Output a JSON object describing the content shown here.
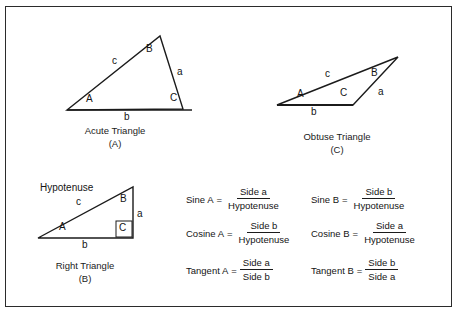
{
  "figure": {
    "border_color": "#2b2b2b",
    "line_color": "#1b1b1b",
    "background": "#ffffff"
  },
  "triangles": [
    {
      "id": "acute",
      "caption": "Acute Triangle",
      "tag": "(A)",
      "vertex_labels": {
        "A": "A",
        "B": "B",
        "C": "C"
      },
      "side_labels": {
        "a": "a",
        "b": "b",
        "c": "c"
      }
    },
    {
      "id": "right",
      "caption": "Right Triangle",
      "tag": "(B)",
      "vertex_labels": {
        "A": "A",
        "B": "B",
        "C": "C"
      },
      "side_labels": {
        "a": "a",
        "b": "b",
        "c": "c"
      },
      "hypotenuse_label": "Hypotenuse",
      "right_angle_marker": true
    },
    {
      "id": "obtuse",
      "caption": "Obtuse Triangle",
      "tag": "(C)",
      "vertex_labels": {
        "A": "A",
        "B": "B",
        "C": "C"
      },
      "side_labels": {
        "a": "a",
        "b": "b",
        "c": "c"
      }
    }
  ],
  "formulas": {
    "column_a": [
      {
        "name": "Sine  A",
        "eq": "=",
        "numerator": "Side  a",
        "denominator": "Hypotenuse"
      },
      {
        "name": "Cosine  A",
        "eq": "=",
        "numerator": "Side  b",
        "denominator": "Hypotenuse"
      },
      {
        "name": "Tangent  A",
        "eq": "=",
        "numerator": "Side  a",
        "denominator": "Side  b"
      }
    ],
    "column_b": [
      {
        "name": "Sine  B",
        "eq": "=",
        "numerator": "Side  b",
        "denominator": "Hypotenuse"
      },
      {
        "name": "Cosine  B",
        "eq": "=",
        "numerator": "Side  a",
        "denominator": "Hypotenuse"
      },
      {
        "name": "Tangent  B",
        "eq": "=",
        "numerator": "Side  b",
        "denominator": "Side  a"
      }
    ]
  }
}
